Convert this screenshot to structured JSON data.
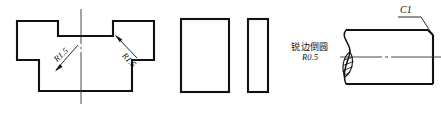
{
  "drawing": {
    "background_color": "#ffffff",
    "line_color": "#111111",
    "centerline_color": "#333333",
    "views": {
      "left_profile": {
        "name": "t-slot-profile-view",
        "radius_label_left": "R1.5",
        "radius_label_right": "R1.5",
        "centerline": "vertical"
      },
      "middle_rect_wide": {
        "name": "rectangle-wide-view"
      },
      "middle_rect_narrow": {
        "name": "rectangle-narrow-view"
      },
      "note": {
        "chinese_text": "锐边倒圆",
        "radius_value": "R0.5"
      },
      "right_shaft": {
        "name": "shaft-break-view",
        "chamfer_label": "C1",
        "break_symbol": "hatched-break",
        "centerline": "horizontal"
      }
    }
  }
}
